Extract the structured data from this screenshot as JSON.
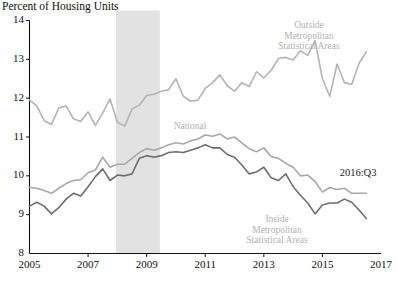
{
  "chart_data": {
    "type": "line",
    "title": "Percent of Housing Units",
    "xlabel": "",
    "ylabel": "Percent of Housing Units",
    "xlim": [
      2005.0,
      2017.0
    ],
    "ylim": [
      8,
      14
    ],
    "grid": false,
    "legend_position": "inline-annotations",
    "xticks": [
      "2005",
      "2007",
      "2009",
      "2011",
      "2013",
      "2015",
      "2017"
    ],
    "xtick_values": [
      2005,
      2007,
      2009,
      2011,
      2013,
      2015,
      2017
    ],
    "yticks": [
      "8",
      "9",
      "10",
      "11",
      "12",
      "13",
      "14"
    ],
    "ytick_values": [
      8,
      9,
      10,
      11,
      12,
      13,
      14
    ],
    "x": [
      2005.0,
      2005.25,
      2005.5,
      2005.75,
      2006.0,
      2006.25,
      2006.5,
      2006.75,
      2007.0,
      2007.25,
      2007.5,
      2007.75,
      2008.0,
      2008.25,
      2008.5,
      2008.75,
      2009.0,
      2009.25,
      2009.5,
      2009.75,
      2010.0,
      2010.25,
      2010.5,
      2010.75,
      2011.0,
      2011.25,
      2011.5,
      2011.75,
      2012.0,
      2012.25,
      2012.5,
      2012.75,
      2013.0,
      2013.25,
      2013.5,
      2013.75,
      2014.0,
      2014.25,
      2014.5,
      2014.75,
      2015.0,
      2015.25,
      2015.5,
      2015.75,
      2016.0,
      2016.25,
      2016.5
    ],
    "series": [
      {
        "name": "Outside Metropolitan Statistical Areas",
        "color": "#b4b4b4",
        "values": [
          11.95,
          11.8,
          11.42,
          11.32,
          11.75,
          11.8,
          11.47,
          11.4,
          11.65,
          11.3,
          11.62,
          11.98,
          11.38,
          11.28,
          11.72,
          11.82,
          12.07,
          12.1,
          12.18,
          12.22,
          12.5,
          12.05,
          11.92,
          11.95,
          12.25,
          12.4,
          12.6,
          12.32,
          12.18,
          12.4,
          12.3,
          12.68,
          12.52,
          12.72,
          13.02,
          13.05,
          12.98,
          13.22,
          13.1,
          13.48,
          12.5,
          12.05,
          12.88,
          12.4,
          12.35,
          12.9,
          13.2
        ]
      },
      {
        "name": "National",
        "color": "#a8a8a8",
        "values": [
          9.7,
          9.68,
          9.62,
          9.55,
          9.68,
          9.8,
          9.88,
          9.9,
          10.08,
          10.15,
          10.48,
          10.22,
          10.3,
          10.3,
          10.45,
          10.6,
          10.7,
          10.66,
          10.72,
          10.8,
          10.85,
          10.82,
          10.9,
          10.95,
          11.05,
          11.02,
          11.08,
          10.95,
          11.0,
          10.85,
          10.7,
          10.62,
          10.72,
          10.5,
          10.45,
          10.32,
          10.22,
          10.0,
          10.02,
          9.85,
          9.58,
          9.7,
          9.65,
          9.68,
          9.55,
          9.55,
          9.55
        ]
      },
      {
        "name": "Inside Metropolitan Statistical Areas",
        "color": "#6e6e6e",
        "values": [
          9.22,
          9.32,
          9.22,
          9.02,
          9.18,
          9.4,
          9.55,
          9.48,
          9.72,
          9.98,
          10.18,
          9.88,
          10.02,
          10.0,
          10.05,
          10.45,
          10.52,
          10.48,
          10.52,
          10.6,
          10.62,
          10.6,
          10.66,
          10.72,
          10.8,
          10.72,
          10.72,
          10.55,
          10.48,
          10.28,
          10.05,
          10.1,
          10.22,
          9.95,
          9.88,
          10.05,
          9.72,
          9.5,
          9.3,
          9.02,
          9.25,
          9.3,
          9.3,
          9.4,
          9.32,
          9.12,
          8.9
        ]
      }
    ],
    "annotations": [
      {
        "id": "outside-msa",
        "text_lines": [
          "Outside",
          "Metropolitan",
          "Statistical Areas"
        ],
        "x": 309,
        "y": 20,
        "style": "light"
      },
      {
        "id": "national",
        "text_lines": [
          "National"
        ],
        "x": 190,
        "y": 121,
        "style": "light"
      },
      {
        "id": "inside-msa",
        "text_lines": [
          "Inside",
          "Metropolitan",
          "Statistical Areas"
        ],
        "x": 277,
        "y": 214,
        "style": "light"
      },
      {
        "id": "last-observation",
        "text_lines": [
          "2016:Q3"
        ],
        "x": 358,
        "y": 168,
        "style": "dark"
      }
    ],
    "shaded_regions": [
      {
        "id": "recession-band",
        "label": "Recession",
        "x_start": 2007.95,
        "x_end": 2009.45,
        "color": "#e2e2e2"
      }
    ]
  }
}
